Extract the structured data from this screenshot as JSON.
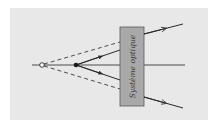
{
  "diagram": {
    "box_label": "Système optique",
    "colors": {
      "panel_background": "#e8e8e8",
      "box_fill": "#a9a9a9",
      "box_stroke": "#5a5a5a",
      "line": "#3a3a3a"
    },
    "elements": {
      "optical_axis": "horizontal axis line",
      "virtual_object_point": "hollow circle on axis",
      "real_object_point": "filled dot on axis",
      "incoming_rays_dashed": 2,
      "incoming_rays_solid": 2,
      "outgoing_rays": 2
    }
  }
}
